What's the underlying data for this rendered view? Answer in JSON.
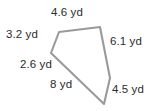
{
  "figure": {
    "type": "polygon-with-side-lengths",
    "units": "yd",
    "stroke_color": "#9a9a9a",
    "fill_color": "#ffffff",
    "text_color": "#2b2b2b",
    "background_color": "#ffffff",
    "vertices": [
      {
        "name": "A",
        "x": 59,
        "y": 32
      },
      {
        "name": "B",
        "x": 100,
        "y": 27
      },
      {
        "name": "C",
        "x": 110,
        "y": 78
      },
      {
        "name": "D",
        "x": 104,
        "y": 104
      },
      {
        "name": "E",
        "x": 51,
        "y": 53
      }
    ],
    "points_attr": "59,32 100,27 110,78 104,104 51,53",
    "labels": {
      "top": "4.6 yd",
      "left": "3.2 yd",
      "right": "6.1 yd",
      "lower_left": "2.6 yd",
      "bottom": "8 yd",
      "bottom_right": "4.5 yd"
    },
    "side_lengths": [
      {
        "label": "4.6 yd",
        "value": 4.6,
        "edge": "A-B",
        "position": "top"
      },
      {
        "label": "6.1 yd",
        "value": 6.1,
        "edge": "B-C",
        "position": "right"
      },
      {
        "label": "4.5 yd",
        "value": 4.5,
        "edge": "C-D",
        "position": "bottom-right"
      },
      {
        "label": "8 yd",
        "value": 8,
        "edge": "D-E",
        "position": "bottom"
      },
      {
        "label": "2.6 yd",
        "value": 2.6,
        "edge": "E",
        "position": "lower-left"
      },
      {
        "label": "3.2 yd",
        "value": 3.2,
        "edge": "E-A",
        "position": "left"
      }
    ]
  }
}
